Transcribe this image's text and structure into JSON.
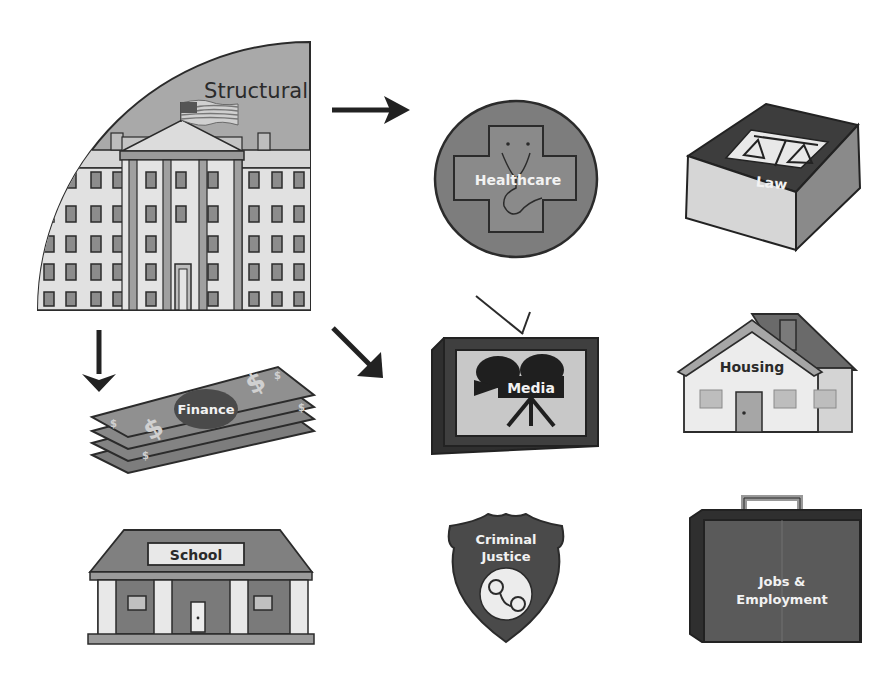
{
  "diagram": {
    "root": {
      "label": "Structural",
      "icon": "government-building-icon"
    },
    "nodes": [
      {
        "id": "healthcare",
        "label": "Healthcare",
        "icon": "medical-cross-icon"
      },
      {
        "id": "law",
        "label": "Law",
        "icon": "law-book-icon"
      },
      {
        "id": "finance",
        "label": "Finance",
        "icon": "money-stack-icon"
      },
      {
        "id": "media",
        "label": "Media",
        "icon": "tv-camera-icon"
      },
      {
        "id": "housing",
        "label": "Housing",
        "icon": "house-icon"
      },
      {
        "id": "school",
        "label": "School",
        "icon": "school-building-icon"
      },
      {
        "id": "criminal_justice",
        "label_line1": "Criminal",
        "label_line2": "Justice",
        "icon": "police-badge-icon"
      },
      {
        "id": "jobs",
        "label_line1": "Jobs &",
        "label_line2": "Employment",
        "icon": "briefcase-icon"
      }
    ],
    "arrows": [
      {
        "from": "structural",
        "direction": "right"
      },
      {
        "from": "structural",
        "direction": "down-right"
      },
      {
        "from": "structural",
        "direction": "down"
      }
    ],
    "colors": {
      "light_gray": "#d9d9d9",
      "mid_gray": "#a6a6a6",
      "dark_gray": "#6e6e6e",
      "darker_gray": "#4a4a4a",
      "outline": "#2b2b2b",
      "label_light": "#f2f2f2"
    }
  }
}
